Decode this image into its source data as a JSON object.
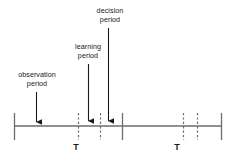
{
  "figure": {
    "type": "timeline-diagram",
    "width": 240,
    "height": 162,
    "background_color": "#ffffff",
    "line_color": "#5a5a5a",
    "arrow_color": "#1a1a1a",
    "text_color": "#1a1a1a"
  },
  "annotations": {
    "observation": {
      "line1": "observation",
      "line2": "period",
      "text_center_x": 37,
      "arrow_x": 36,
      "arrow_top_y": 92,
      "arrow_bottom_y": 122
    },
    "learning": {
      "line1": "learning",
      "line2": "period",
      "text_center_x": 88,
      "arrow_x": 88,
      "arrow_top_y": 64,
      "arrow_bottom_y": 121
    },
    "decision": {
      "line1": "decision",
      "line2": "period",
      "text_center_x": 110,
      "arrow_x": 108,
      "arrow_top_y": 28,
      "arrow_bottom_y": 121
    }
  },
  "axis": {
    "baseline_y": 126,
    "start_x": 14,
    "end_x": 222,
    "solid_ticks": [
      {
        "x": 14,
        "top": 113,
        "bottom": 140
      },
      {
        "x": 122,
        "top": 113,
        "bottom": 140
      },
      {
        "x": 222,
        "top": 113,
        "bottom": 140
      }
    ],
    "dashed_ticks": [
      {
        "x": 78,
        "top": 113,
        "bottom": 140
      },
      {
        "x": 100,
        "top": 113,
        "bottom": 140
      },
      {
        "x": 183,
        "top": 113,
        "bottom": 140
      },
      {
        "x": 197,
        "top": 113,
        "bottom": 140
      }
    ],
    "tick_labels": [
      {
        "text": "T",
        "x": 76,
        "y": 142
      },
      {
        "text": "T",
        "x": 177,
        "y": 142
      }
    ]
  }
}
